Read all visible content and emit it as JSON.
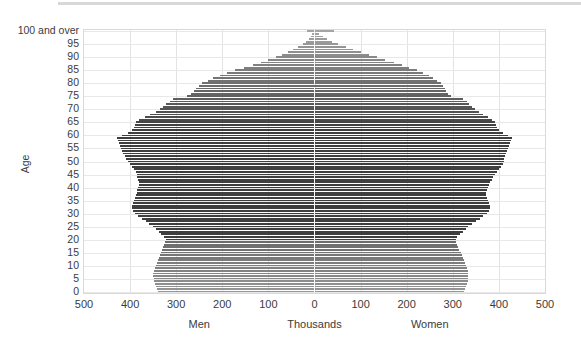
{
  "chart_data": {
    "type": "bar",
    "title": "",
    "subtitle": "",
    "orientation": "horizontal-diverging",
    "xlabel": "Thousands",
    "ylabel": "Age",
    "xlim": [
      -500,
      500
    ],
    "ylim": [
      0,
      100
    ],
    "grid": true,
    "legend_position": "none",
    "x_tick_labels": [
      "500",
      "400",
      "300",
      "200",
      "100",
      "0",
      "100",
      "200",
      "300",
      "400",
      "500"
    ],
    "x_tick_values": [
      -500,
      -400,
      -300,
      -200,
      -100,
      0,
      100,
      200,
      300,
      400,
      500
    ],
    "y_tick_labels": [
      "0",
      "5",
      "10",
      "15",
      "20",
      "25",
      "30",
      "35",
      "40",
      "45",
      "50",
      "55",
      "60",
      "65",
      "70",
      "75",
      "80",
      "85",
      "90",
      "95",
      "100 and over"
    ],
    "y_tick_values": [
      0,
      5,
      10,
      15,
      20,
      25,
      30,
      35,
      40,
      45,
      50,
      55,
      60,
      65,
      70,
      75,
      80,
      85,
      90,
      95,
      100
    ],
    "annotations": [
      {
        "text": "Men",
        "side": "left",
        "x_value": -250
      },
      {
        "text": "Women",
        "side": "right",
        "x_value": 250
      },
      {
        "text": "Thousands",
        "side": "center",
        "x_value": 0
      }
    ],
    "units": "thousands of people",
    "categories": [
      0,
      1,
      2,
      3,
      4,
      5,
      6,
      7,
      8,
      9,
      10,
      11,
      12,
      13,
      14,
      15,
      16,
      17,
      18,
      19,
      20,
      21,
      22,
      23,
      24,
      25,
      26,
      27,
      28,
      29,
      30,
      31,
      32,
      33,
      34,
      35,
      36,
      37,
      38,
      39,
      40,
      41,
      42,
      43,
      44,
      45,
      46,
      47,
      48,
      49,
      50,
      51,
      52,
      53,
      54,
      55,
      56,
      57,
      58,
      59,
      60,
      61,
      62,
      63,
      64,
      65,
      66,
      67,
      68,
      69,
      70,
      71,
      72,
      73,
      74,
      75,
      76,
      77,
      78,
      79,
      80,
      81,
      82,
      83,
      84,
      85,
      86,
      87,
      88,
      89,
      90,
      91,
      92,
      93,
      94,
      95,
      96,
      97,
      98,
      99,
      100
    ],
    "series": [
      {
        "name": "Men",
        "color": "#5a5a5a",
        "values": [
          340,
          342,
          344,
          346,
          348,
          349,
          350,
          350,
          348,
          346,
          344,
          342,
          340,
          338,
          336,
          334,
          330,
          328,
          326,
          324,
          322,
          326,
          332,
          338,
          344,
          350,
          358,
          366,
          374,
          382,
          390,
          394,
          396,
          396,
          394,
          392,
          390,
          388,
          386,
          384,
          382,
          380,
          380,
          382,
          384,
          386,
          388,
          392,
          396,
          400,
          404,
          408,
          412,
          416,
          418,
          420,
          422,
          424,
          426,
          428,
          418,
          404,
          396,
          392,
          390,
          388,
          380,
          368,
          356,
          344,
          336,
          328,
          322,
          314,
          306,
          276,
          268,
          262,
          256,
          250,
          244,
          232,
          220,
          206,
          190,
          172,
          152,
          134,
          116,
          100,
          84,
          70,
          58,
          46,
          36,
          26,
          18,
          12,
          8,
          5,
          16
        ]
      },
      {
        "name": "Women",
        "color": "#5a5a5a",
        "values": [
          324,
          326,
          328,
          330,
          332,
          333,
          334,
          334,
          332,
          330,
          328,
          326,
          324,
          322,
          320,
          318,
          314,
          312,
          310,
          308,
          306,
          310,
          316,
          322,
          328,
          334,
          342,
          350,
          358,
          366,
          374,
          378,
          380,
          380,
          378,
          376,
          374,
          372,
          372,
          374,
          376,
          378,
          380,
          384,
          388,
          392,
          396,
          400,
          404,
          408,
          410,
          412,
          414,
          416,
          418,
          420,
          422,
          424,
          426,
          428,
          420,
          408,
          400,
          396,
          394,
          392,
          386,
          376,
          366,
          356,
          348,
          342,
          336,
          330,
          322,
          296,
          290,
          286,
          282,
          278,
          274,
          266,
          258,
          248,
          236,
          222,
          206,
          190,
          172,
          154,
          136,
          118,
          100,
          84,
          68,
          52,
          38,
          28,
          18,
          10,
          42
        ]
      }
    ]
  },
  "style": {
    "bar_color_dark": "#4a4a4a",
    "bar_color_light": "#b8b8b8",
    "gridline_color": "#e8e8e8",
    "axis_border_color": "#d9d9d9",
    "text_color": "#3b3b3b",
    "background": "#ffffff"
  }
}
